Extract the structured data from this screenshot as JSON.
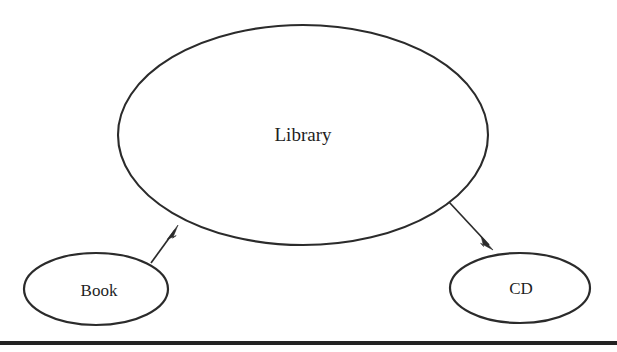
{
  "diagram": {
    "type": "aggregation-diagram",
    "background_color": "#ffffff",
    "stroke_color": "#2b2b2b",
    "nodes": [
      {
        "id": "library",
        "label": "Library",
        "shape": "ellipse",
        "cx": 303,
        "cy": 135,
        "rx": 185,
        "ry": 110
      },
      {
        "id": "book",
        "label": "Book",
        "shape": "ellipse",
        "cx": 96,
        "cy": 289,
        "rx": 72,
        "ry": 36
      },
      {
        "id": "cd",
        "label": "CD",
        "shape": "ellipse",
        "cx": 520,
        "cy": 288,
        "rx": 70,
        "ry": 35
      }
    ],
    "edges": [
      {
        "id": "book-to-library",
        "from": "book",
        "to": "library",
        "direction": "to-library",
        "arrowhead": "filled",
        "x1": 151,
        "y1": 263,
        "x2": 178,
        "y2": 226
      },
      {
        "id": "library-to-cd",
        "from": "library",
        "to": "cd",
        "direction": "to-cd",
        "arrowhead": "filled",
        "x1": 449,
        "y1": 202,
        "x2": 493,
        "y2": 250
      }
    ],
    "rule": {
      "label": "horizontal-rule",
      "x": 0,
      "y": 341,
      "width": 617,
      "height": 4,
      "color": "#232323"
    }
  }
}
